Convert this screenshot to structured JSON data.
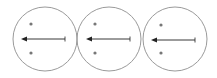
{
  "diagram": {
    "background": "#ffffff",
    "stroke_color": "#9a9a9a",
    "arrow_color": "#222222",
    "dot_color": "#777777",
    "circles": [
      {
        "cx": 45,
        "cy": 39,
        "r": 32,
        "dots": [
          {
            "x": 31,
            "y": 24
          },
          {
            "x": 31,
            "y": 53
          }
        ],
        "arrow": {
          "x1": 65,
          "x2": 21,
          "y": 39
        }
      },
      {
        "cx": 109,
        "cy": 39,
        "r": 32,
        "dots": [
          {
            "x": 95,
            "y": 24
          },
          {
            "x": 95,
            "y": 53
          }
        ],
        "arrow": {
          "x1": 130,
          "x2": 86,
          "y": 39
        }
      },
      {
        "cx": 175,
        "cy": 39,
        "r": 32,
        "dots": [
          {
            "x": 161,
            "y": 25
          },
          {
            "x": 161,
            "y": 53
          }
        ],
        "arrow": {
          "x1": 195,
          "x2": 151,
          "y": 40
        }
      }
    ]
  }
}
